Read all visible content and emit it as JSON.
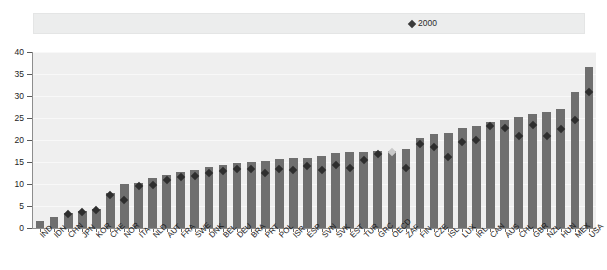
{
  "figure": {
    "title_fragment": "",
    "background": "#ffffff",
    "plot_background": "#efefef",
    "bar_color": "#6f6f6f",
    "marker_color": "#2e2e2e",
    "muted_marker_color": "#c9c9c9",
    "legend_background": "#eceded"
  },
  "legend": {
    "position": "top",
    "entries": [
      {
        "label": "2010 or latest available",
        "type": "bar",
        "icon": "bar-swatch-icon"
      },
      {
        "label": "2000",
        "type": "marker",
        "icon": "diamond-marker-icon"
      }
    ]
  },
  "chart_data": {
    "type": "bar",
    "title": "",
    "subtitle": "",
    "xlabel": "",
    "ylabel": "",
    "ylim": [
      0,
      40
    ],
    "yticks": [
      0,
      5,
      10,
      15,
      20,
      25,
      30,
      35,
      40
    ],
    "ytick_labels": [
      "0",
      "5",
      "10",
      "15",
      "20",
      "25",
      "30",
      "35",
      "40"
    ],
    "grid": true,
    "legend_position": "top",
    "categories": [
      "IND",
      "IDN",
      "CHN",
      "JPN",
      "KOR",
      "CHE",
      "NOR",
      "ITA",
      "NLD",
      "AUT",
      "FRA",
      "SWE",
      "DNK",
      "BEL",
      "DEU",
      "BRA",
      "PRT",
      "POL",
      "ISR",
      "ESP",
      "SVN",
      "SVK",
      "EST",
      "TUR",
      "GRC",
      "OECD",
      "ZAF",
      "FIN",
      "CZE",
      "ISL",
      "LUX",
      "IRL",
      "CAN",
      "AUS",
      "CHL",
      "GBR",
      "NZL",
      "HUN",
      "MEX",
      "USA"
    ],
    "series": [
      {
        "name": "2010 or latest available",
        "type": "bar",
        "values": [
          1.5,
          2.5,
          3.5,
          3.8,
          4.3,
          8.0,
          10.0,
          10.3,
          11.3,
          12.0,
          12.8,
          13.2,
          13.8,
          14.3,
          14.8,
          15.0,
          15.3,
          15.6,
          15.8,
          16.0,
          16.3,
          17.0,
          17.2,
          17.3,
          17.5,
          17.6,
          18.0,
          20.5,
          21.3,
          21.5,
          22.8,
          23.2,
          24.2,
          24.5,
          25.3,
          25.8,
          26.3,
          27.0,
          30.8,
          36.5
        ]
      },
      {
        "name": "2000",
        "type": "marker",
        "marker": "diamond",
        "values": [
          null,
          null,
          3.2,
          3.6,
          4.2,
          7.5,
          6.4,
          9.5,
          9.8,
          11.0,
          11.6,
          11.8,
          12.4,
          13.0,
          13.3,
          13.5,
          12.5,
          13.5,
          13.2,
          14.0,
          13.2,
          14.4,
          13.6,
          15.4,
          16.8,
          17.2,
          13.6,
          19.0,
          18.4,
          16.2,
          19.6,
          20.0,
          23.2,
          22.8,
          20.8,
          23.4,
          21.0,
          22.6,
          24.6,
          31.0
        ]
      }
    ]
  }
}
